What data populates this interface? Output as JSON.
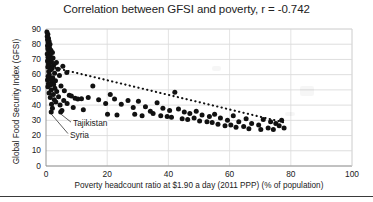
{
  "chart_data": {
    "type": "scatter",
    "title": "Correlation between GFSI and poverty, r = -0.742",
    "xlabel": "Poverty headcount ratio at $1.90 a day (2011 PPP) (% of population)",
    "ylabel": "Global Food Security Index (GFSI)",
    "xlim": [
      0,
      100
    ],
    "ylim": [
      0,
      90
    ],
    "xticks": [
      0,
      20,
      40,
      60,
      80,
      100
    ],
    "yticks": [
      0,
      10,
      20,
      30,
      40,
      50,
      60,
      70,
      80,
      90
    ],
    "grid": "horizontal-and-vertical-light",
    "legend": "none",
    "correlation_r": -0.742,
    "marker_color": "#111111",
    "trendline": {
      "style": "dotted",
      "color": "#111111",
      "x_start": 3,
      "y_start": 64.5,
      "x_end": 78,
      "y_end": 28.5
    },
    "annotations": [
      {
        "label": "Tajikistan",
        "point_x": 4.8,
        "point_y": 35.5,
        "text_x": 8.5,
        "text_y": 27.5
      },
      {
        "label": "Syria",
        "point_x": 1.7,
        "point_y": 35.5,
        "text_x": 7.5,
        "text_y": 20.0
      }
    ],
    "points": [
      {
        "x": 0.3,
        "y": 88.0
      },
      {
        "x": 0.6,
        "y": 86.5
      },
      {
        "x": 0.4,
        "y": 85.0
      },
      {
        "x": 0.8,
        "y": 84.0
      },
      {
        "x": 0.5,
        "y": 83.0
      },
      {
        "x": 1.0,
        "y": 82.0
      },
      {
        "x": 0.7,
        "y": 81.0
      },
      {
        "x": 1.3,
        "y": 80.0
      },
      {
        "x": 0.5,
        "y": 79.0
      },
      {
        "x": 1.1,
        "y": 78.0
      },
      {
        "x": 0.6,
        "y": 77.0
      },
      {
        "x": 1.6,
        "y": 76.0
      },
      {
        "x": 0.9,
        "y": 75.0
      },
      {
        "x": 2.1,
        "y": 74.5
      },
      {
        "x": 0.4,
        "y": 73.5
      },
      {
        "x": 1.4,
        "y": 72.5
      },
      {
        "x": 0.7,
        "y": 71.5
      },
      {
        "x": 2.3,
        "y": 71.0
      },
      {
        "x": 1.0,
        "y": 70.0
      },
      {
        "x": 0.5,
        "y": 69.0
      },
      {
        "x": 1.8,
        "y": 68.5
      },
      {
        "x": 3.4,
        "y": 68.0
      },
      {
        "x": 0.8,
        "y": 67.0
      },
      {
        "x": 2.6,
        "y": 66.5
      },
      {
        "x": 1.2,
        "y": 66.0
      },
      {
        "x": 5.5,
        "y": 65.5
      },
      {
        "x": 0.6,
        "y": 65.0
      },
      {
        "x": 2.0,
        "y": 64.0
      },
      {
        "x": 3.9,
        "y": 63.5
      },
      {
        "x": 1.5,
        "y": 63.0
      },
      {
        "x": 0.9,
        "y": 62.0
      },
      {
        "x": 6.8,
        "y": 61.5
      },
      {
        "x": 2.8,
        "y": 61.0
      },
      {
        "x": 1.1,
        "y": 60.0
      },
      {
        "x": 4.4,
        "y": 59.5
      },
      {
        "x": 0.7,
        "y": 59.0
      },
      {
        "x": 2.2,
        "y": 58.0
      },
      {
        "x": 1.6,
        "y": 57.0
      },
      {
        "x": 0.5,
        "y": 56.5
      },
      {
        "x": 3.1,
        "y": 56.0
      },
      {
        "x": 1.9,
        "y": 55.0
      },
      {
        "x": 0.8,
        "y": 54.0
      },
      {
        "x": 2.5,
        "y": 53.5
      },
      {
        "x": 1.3,
        "y": 53.0
      },
      {
        "x": 4.9,
        "y": 52.5
      },
      {
        "x": 0.6,
        "y": 52.0
      },
      {
        "x": 2.9,
        "y": 51.0
      },
      {
        "x": 1.7,
        "y": 50.0
      },
      {
        "x": 6.0,
        "y": 49.5
      },
      {
        "x": 3.5,
        "y": 49.0
      },
      {
        "x": 1.0,
        "y": 48.0
      },
      {
        "x": 2.4,
        "y": 47.0
      },
      {
        "x": 7.6,
        "y": 46.5
      },
      {
        "x": 8.3,
        "y": 46.0
      },
      {
        "x": 4.1,
        "y": 45.5
      },
      {
        "x": 1.4,
        "y": 45.0
      },
      {
        "x": 9.5,
        "y": 44.5
      },
      {
        "x": 10.4,
        "y": 44.0
      },
      {
        "x": 2.7,
        "y": 43.5
      },
      {
        "x": 5.8,
        "y": 43.0
      },
      {
        "x": 11.6,
        "y": 44.2
      },
      {
        "x": 3.2,
        "y": 42.0
      },
      {
        "x": 6.9,
        "y": 41.0
      },
      {
        "x": 13.8,
        "y": 45.0
      },
      {
        "x": 1.8,
        "y": 40.5
      },
      {
        "x": 4.6,
        "y": 40.0
      },
      {
        "x": 15.3,
        "y": 52.5
      },
      {
        "x": 8.9,
        "y": 38.5
      },
      {
        "x": 2.1,
        "y": 38.0
      },
      {
        "x": 17.2,
        "y": 43.5
      },
      {
        "x": 5.2,
        "y": 36.5
      },
      {
        "x": 1.7,
        "y": 35.5
      },
      {
        "x": 4.8,
        "y": 35.5
      },
      {
        "x": 12.2,
        "y": 37.0
      },
      {
        "x": 19.5,
        "y": 41.0
      },
      {
        "x": 21.0,
        "y": 47.0
      },
      {
        "x": 22.4,
        "y": 44.0
      },
      {
        "x": 20.1,
        "y": 34.0
      },
      {
        "x": 24.6,
        "y": 40.5
      },
      {
        "x": 26.8,
        "y": 43.0
      },
      {
        "x": 23.2,
        "y": 33.5
      },
      {
        "x": 28.5,
        "y": 38.5
      },
      {
        "x": 30.2,
        "y": 42.5
      },
      {
        "x": 29.0,
        "y": 34.0
      },
      {
        "x": 32.5,
        "y": 39.0
      },
      {
        "x": 34.1,
        "y": 36.0
      },
      {
        "x": 31.4,
        "y": 33.0
      },
      {
        "x": 36.3,
        "y": 41.5
      },
      {
        "x": 35.0,
        "y": 34.5
      },
      {
        "x": 38.2,
        "y": 38.0
      },
      {
        "x": 37.5,
        "y": 33.0
      },
      {
        "x": 40.4,
        "y": 36.5
      },
      {
        "x": 39.6,
        "y": 32.5
      },
      {
        "x": 42.1,
        "y": 48.5
      },
      {
        "x": 43.3,
        "y": 37.5
      },
      {
        "x": 41.0,
        "y": 32.0
      },
      {
        "x": 45.2,
        "y": 35.5
      },
      {
        "x": 44.5,
        "y": 31.0
      },
      {
        "x": 47.0,
        "y": 34.5
      },
      {
        "x": 46.3,
        "y": 30.5
      },
      {
        "x": 49.1,
        "y": 36.0
      },
      {
        "x": 48.4,
        "y": 31.5
      },
      {
        "x": 51.0,
        "y": 33.5
      },
      {
        "x": 50.2,
        "y": 29.5
      },
      {
        "x": 53.4,
        "y": 32.5
      },
      {
        "x": 52.6,
        "y": 29.0
      },
      {
        "x": 55.1,
        "y": 34.0
      },
      {
        "x": 54.3,
        "y": 28.5
      },
      {
        "x": 57.0,
        "y": 31.5
      },
      {
        "x": 56.2,
        "y": 27.5
      },
      {
        "x": 59.3,
        "y": 30.0
      },
      {
        "x": 58.5,
        "y": 26.5
      },
      {
        "x": 61.2,
        "y": 33.0
      },
      {
        "x": 60.4,
        "y": 27.0
      },
      {
        "x": 63.0,
        "y": 29.0
      },
      {
        "x": 62.1,
        "y": 25.5
      },
      {
        "x": 65.4,
        "y": 31.0
      },
      {
        "x": 64.6,
        "y": 26.0
      },
      {
        "x": 67.2,
        "y": 28.0
      },
      {
        "x": 66.3,
        "y": 24.5
      },
      {
        "x": 69.5,
        "y": 27.0
      },
      {
        "x": 71.0,
        "y": 30.5
      },
      {
        "x": 70.2,
        "y": 24.0
      },
      {
        "x": 73.4,
        "y": 29.0
      },
      {
        "x": 72.6,
        "y": 25.0
      },
      {
        "x": 75.1,
        "y": 28.0
      },
      {
        "x": 74.3,
        "y": 24.0
      },
      {
        "x": 77.0,
        "y": 30.0
      },
      {
        "x": 76.2,
        "y": 26.5
      },
      {
        "x": 77.8,
        "y": 25.0
      }
    ]
  }
}
